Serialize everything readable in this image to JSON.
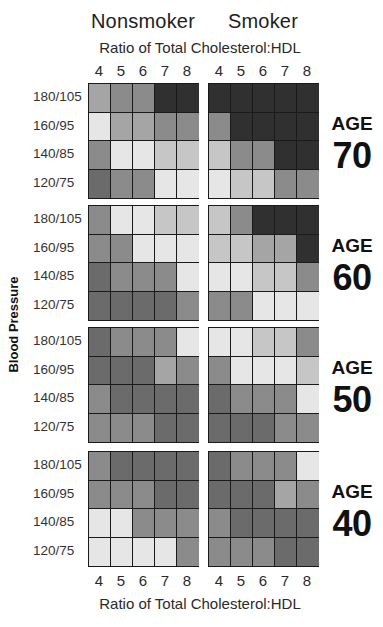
{
  "header": {
    "nonsmoker_label": "Nonsmoker",
    "smoker_label": "Smoker",
    "x_axis_title_top": "Ratio of Total Cholesterol:HDL",
    "x_axis_title_bottom": "Ratio of Total Cholesterol:HDL"
  },
  "x_ticks": [
    "4",
    "5",
    "6",
    "7",
    "8"
  ],
  "y_axis_title": "Blood Pressure",
  "bp_labels": [
    "180/105",
    "160/95",
    "140/85",
    "120/75"
  ],
  "age_word": "AGE",
  "shade_colors": [
    "#e6e6e6",
    "#c6c6c6",
    "#a5a5a5",
    "#8b8b8b",
    "#6b6b6b",
    "#303030"
  ],
  "chart_data": {
    "type": "heatmap",
    "title": "",
    "xlabel": "Ratio of Total Cholesterol:HDL",
    "ylabel": "Blood Pressure",
    "x_categories": [
      "4",
      "5",
      "6",
      "7",
      "8"
    ],
    "y_categories": [
      "180/105",
      "160/95",
      "140/85",
      "120/75"
    ],
    "groups": [
      "Nonsmoker",
      "Smoker"
    ],
    "value_scale": "0 = lightest shade (lowest risk) to 5 = darkest shade (highest risk)",
    "panels": [
      {
        "age": "70",
        "nonsmoker": [
          [
            2,
            3,
            3,
            5,
            5
          ],
          [
            0,
            2,
            2,
            3,
            3
          ],
          [
            3,
            0,
            0,
            1,
            1
          ],
          [
            4,
            3,
            3,
            0,
            0
          ]
        ],
        "smoker": [
          [
            5,
            5,
            5,
            5,
            5
          ],
          [
            3,
            5,
            5,
            5,
            5
          ],
          [
            1,
            3,
            3,
            5,
            5
          ],
          [
            0,
            1,
            1,
            3,
            3
          ]
        ]
      },
      {
        "age": "60",
        "nonsmoker": [
          [
            3,
            0,
            0,
            1,
            1
          ],
          [
            3,
            3,
            0,
            0,
            0
          ],
          [
            4,
            3,
            3,
            3,
            0
          ],
          [
            4,
            4,
            4,
            4,
            3
          ]
        ],
        "smoker": [
          [
            1,
            3,
            5,
            5,
            5
          ],
          [
            1,
            1,
            2,
            2,
            5
          ],
          [
            0,
            0,
            1,
            1,
            3
          ],
          [
            3,
            3,
            0,
            0,
            0
          ]
        ]
      },
      {
        "age": "50",
        "nonsmoker": [
          [
            4,
            3,
            3,
            3,
            0
          ],
          [
            4,
            4,
            4,
            2,
            3
          ],
          [
            3,
            4,
            4,
            4,
            4
          ],
          [
            3,
            3,
            3,
            4,
            4
          ]
        ],
        "smoker": [
          [
            0,
            0,
            1,
            1,
            3
          ],
          [
            3,
            0,
            0,
            0,
            1
          ],
          [
            4,
            3,
            3,
            3,
            0
          ],
          [
            4,
            4,
            4,
            3,
            3
          ]
        ]
      },
      {
        "age": "40",
        "nonsmoker": [
          [
            3,
            4,
            4,
            4,
            4
          ],
          [
            3,
            3,
            3,
            4,
            4
          ],
          [
            0,
            0,
            3,
            3,
            3
          ],
          [
            0,
            0,
            0,
            0,
            3
          ]
        ],
        "smoker": [
          [
            4,
            3,
            3,
            3,
            0
          ],
          [
            4,
            4,
            4,
            2,
            3
          ],
          [
            3,
            4,
            4,
            4,
            4
          ],
          [
            3,
            3,
            3,
            4,
            4
          ]
        ]
      }
    ],
    "grid": true,
    "legend": "none"
  }
}
